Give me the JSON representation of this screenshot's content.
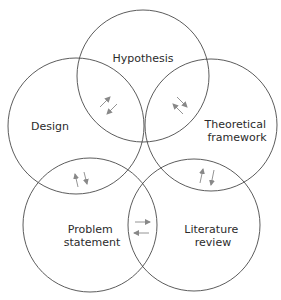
{
  "diagram": {
    "type": "overlapping-circles",
    "nodes": [
      {
        "id": "hypothesis",
        "label_lines": [
          "Hypothesis"
        ]
      },
      {
        "id": "design",
        "label_lines": [
          "Design"
        ]
      },
      {
        "id": "theoretical",
        "label_lines": [
          "Theoretical",
          "framework"
        ]
      },
      {
        "id": "problem",
        "label_lines": [
          "Problem",
          "statement"
        ]
      },
      {
        "id": "literature",
        "label_lines": [
          "Literature",
          "review"
        ]
      }
    ],
    "bidirectional_links": [
      [
        "design",
        "hypothesis"
      ],
      [
        "hypothesis",
        "theoretical"
      ],
      [
        "design",
        "problem"
      ],
      [
        "theoretical",
        "literature"
      ],
      [
        "problem",
        "literature"
      ]
    ],
    "colors": {
      "stroke": "#4a4a4a",
      "arrow": "#888888",
      "text": "#2b2b2b",
      "background": "#ffffff"
    }
  }
}
